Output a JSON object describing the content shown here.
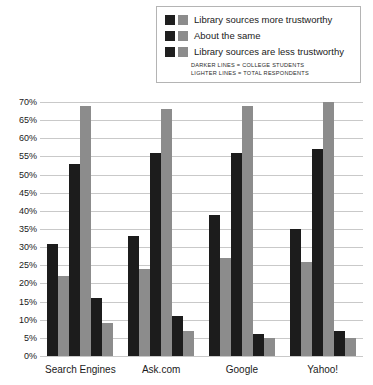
{
  "legend": {
    "entries": [
      {
        "label": "Library sources more trustworthy",
        "dark_swatch": "dark-swatch-icon",
        "light_swatch": "light-swatch-icon"
      },
      {
        "label": "About the same",
        "dark_swatch": "dark-swatch-icon",
        "light_swatch": "light-swatch-icon"
      },
      {
        "label": "Library sources are less trustworthy",
        "dark_swatch": "dark-swatch-icon",
        "light_swatch": "light-swatch-icon"
      }
    ],
    "notes": [
      "DARKER LINES = COLLEGE STUDENTS",
      "LIGHTER LINES = TOTAL RESPONDENTS"
    ]
  },
  "colors": {
    "dark_series": "#1c1c1c",
    "light_series": "#8c8c8c",
    "gridline": "#c9c9c9",
    "axis": "#5a5a5a",
    "background": "#ffffff"
  },
  "chart_data": {
    "type": "bar",
    "title": "",
    "xlabel": "",
    "ylabel": "",
    "ylim": [
      0,
      70
    ],
    "ytick_values": [
      70,
      65,
      60,
      55,
      50,
      45,
      40,
      35,
      30,
      25,
      20,
      15,
      10,
      5,
      0
    ],
    "ytick_labels": [
      "70%",
      "65%",
      "60%",
      "55%",
      "50%",
      "45%",
      "40%",
      "35%",
      "30%",
      "25%",
      "20%",
      "15%",
      "10%",
      "5%",
      "0%"
    ],
    "grid": true,
    "legend_position": "top-right",
    "categories": [
      "Search Engines",
      "Ask.com",
      "Google",
      "Yahoo!"
    ],
    "series": [
      {
        "name": "Library sources more trustworthy — college students",
        "group": "College students",
        "answer": "Library sources more trustworthy",
        "shade": "dark",
        "values": [
          31,
          33,
          39,
          35
        ]
      },
      {
        "name": "Library sources more trustworthy — total respondents",
        "group": "Total respondents",
        "answer": "Library sources more trustworthy",
        "shade": "light",
        "values": [
          22,
          24,
          27,
          26
        ]
      },
      {
        "name": "About the same — college students",
        "group": "College students",
        "answer": "About the same",
        "shade": "dark",
        "values": [
          53,
          56,
          56,
          57
        ]
      },
      {
        "name": "About the same — total respondents",
        "group": "Total respondents",
        "answer": "About the same",
        "shade": "light",
        "values": [
          69,
          68,
          69,
          70
        ]
      },
      {
        "name": "Library sources are less trustworthy — college students",
        "group": "College students",
        "answer": "Library sources are less trustworthy",
        "shade": "dark",
        "values": [
          16,
          11,
          6,
          7
        ]
      },
      {
        "name": "Library sources are less trustworthy — total respondents",
        "group": "Total respondents",
        "answer": "Library sources are less trustworthy",
        "shade": "light",
        "values": [
          9,
          7,
          5,
          5
        ]
      }
    ]
  }
}
